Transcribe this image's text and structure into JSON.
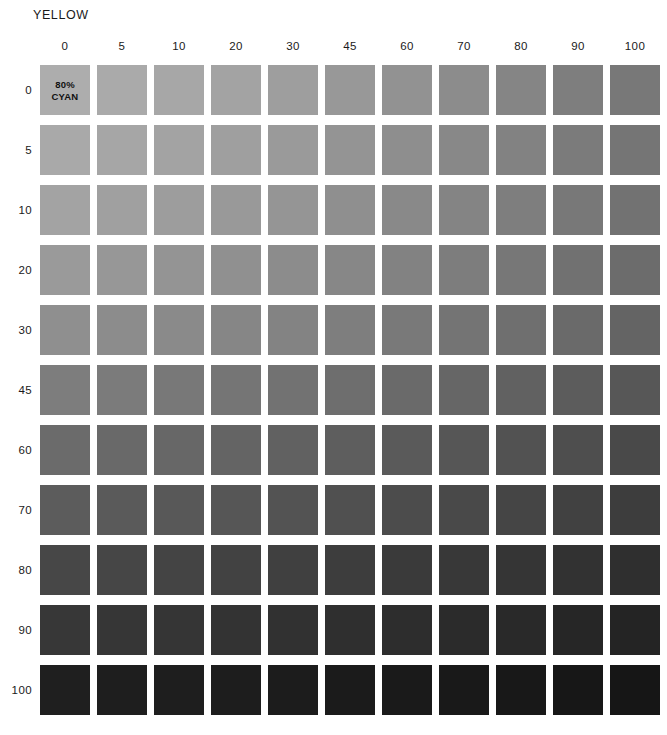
{
  "title": "YELLOW",
  "corner_label": {
    "line1": "80%",
    "line2": "CYAN"
  },
  "base_ink": "80% CYAN",
  "layout": {
    "cell_size": 50,
    "col_pitch": 57,
    "row_pitch": 60,
    "grid_left": 40,
    "grid_top": 65,
    "header_top": 40,
    "title_left": 33,
    "title_top": 8
  },
  "chart_data": {
    "type": "heatmap",
    "title": "YELLOW",
    "subtitle": "80% CYAN",
    "xlabel": "YELLOW",
    "ylabel": "",
    "grid": false,
    "legend": "none",
    "x": [
      "0",
      "5",
      "10",
      "20",
      "30",
      "45",
      "60",
      "70",
      "80",
      "90",
      "100"
    ],
    "y": [
      "0",
      "5",
      "10",
      "20",
      "30",
      "45",
      "60",
      "70",
      "80",
      "90",
      "100"
    ],
    "xlim": [
      0,
      100
    ],
    "ylim": [
      0,
      100
    ],
    "column_headers": [
      "0",
      "5",
      "10",
      "20",
      "30",
      "45",
      "60",
      "70",
      "80",
      "90",
      "100"
    ],
    "row_headers": [
      "0",
      "5",
      "10",
      "20",
      "30",
      "45",
      "60",
      "70",
      "80",
      "90",
      "100"
    ],
    "annotations": [
      {
        "row": 0,
        "col": 0,
        "text": "80% CYAN"
      }
    ],
    "colors": [
      [
        "#adadad",
        "#aaaaaa",
        "#a7a7a7",
        "#a3a3a3",
        "#9e9e9e",
        "#989898",
        "#929292",
        "#8c8c8c",
        "#858585",
        "#7e7e7e",
        "#787878"
      ],
      [
        "#a9a9a9",
        "#a6a6a6",
        "#a3a3a3",
        "#9f9f9f",
        "#9a9a9a",
        "#949494",
        "#8e8e8e",
        "#888888",
        "#828282",
        "#7b7b7b",
        "#757575"
      ],
      [
        "#a3a3a3",
        "#a0a0a0",
        "#9d9d9d",
        "#999999",
        "#959595",
        "#8f8f8f",
        "#898989",
        "#848484",
        "#7e7e7e",
        "#787878",
        "#727272"
      ],
      [
        "#9a9a9a",
        "#979797",
        "#949494",
        "#909090",
        "#8c8c8c",
        "#878787",
        "#828282",
        "#7d7d7d",
        "#777777",
        "#717171",
        "#6c6c6c"
      ],
      [
        "#8f8f8f",
        "#8c8c8c",
        "#8a8a8a",
        "#868686",
        "#838383",
        "#7e7e7e",
        "#797979",
        "#747474",
        "#6f6f6f",
        "#6a6a6a",
        "#646464"
      ],
      [
        "#7d7d7d",
        "#7b7b7b",
        "#787878",
        "#757575",
        "#727272",
        "#6e6e6e",
        "#6a6a6a",
        "#666666",
        "#616161",
        "#5c5c5c",
        "#575757"
      ],
      [
        "#6b6b6b",
        "#696969",
        "#676767",
        "#646464",
        "#616161",
        "#5e5e5e",
        "#5a5a5a",
        "#565656",
        "#525252",
        "#4e4e4e",
        "#494949"
      ],
      [
        "#5c5c5c",
        "#5a5a5a",
        "#585858",
        "#565656",
        "#535353",
        "#505050",
        "#4c4c4c",
        "#494949",
        "#454545",
        "#414141",
        "#3d3d3d"
      ],
      [
        "#474747",
        "#464646",
        "#444444",
        "#424242",
        "#404040",
        "#3d3d3d",
        "#3a3a3a",
        "#383838",
        "#353535",
        "#323232",
        "#2f2f2f"
      ],
      [
        "#373737",
        "#363636",
        "#353535",
        "#333333",
        "#313131",
        "#2f2f2f",
        "#2d2d2d",
        "#2b2b2b",
        "#292929",
        "#262626",
        "#242424"
      ],
      [
        "#1f1f1f",
        "#1e1e1e",
        "#1e1e1e",
        "#1d1d1d",
        "#1c1c1c",
        "#1b1b1b",
        "#1a1a1a",
        "#191919",
        "#181818",
        "#171717",
        "#161616"
      ]
    ]
  }
}
